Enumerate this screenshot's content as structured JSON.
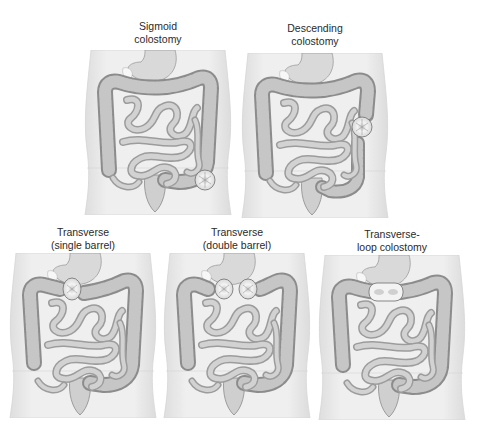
{
  "figure": {
    "panels": [
      {
        "id": "sigmoid",
        "line1": "Sigmoid",
        "line2": "colostomy",
        "stoma_type": "single",
        "stoma_location": "lower-left sigmoid colon"
      },
      {
        "id": "descending",
        "line1": "Descending",
        "line2": "colostomy",
        "stoma_type": "single",
        "stoma_location": "descending colon"
      },
      {
        "id": "transverse-single",
        "line1": "Transverse",
        "line2": "(single barrel)",
        "stoma_type": "single",
        "stoma_location": "right transverse colon"
      },
      {
        "id": "transverse-double",
        "line1": "Transverse",
        "line2": "(double barrel)",
        "stoma_type": "double",
        "stoma_location": "transverse colon"
      },
      {
        "id": "transverse-loop",
        "line1": "Transverse-",
        "line2": "loop colostomy",
        "stoma_type": "loop",
        "stoma_location": "transverse colon"
      }
    ],
    "colors": {
      "background": "#ffffff",
      "torso": "#e9e9e9",
      "colon": "#bdbdbd",
      "small_intestine": "#a9a9a9",
      "stoma": "#f2f2f2",
      "outline": "#777777",
      "label": "#2a2a2a"
    }
  }
}
